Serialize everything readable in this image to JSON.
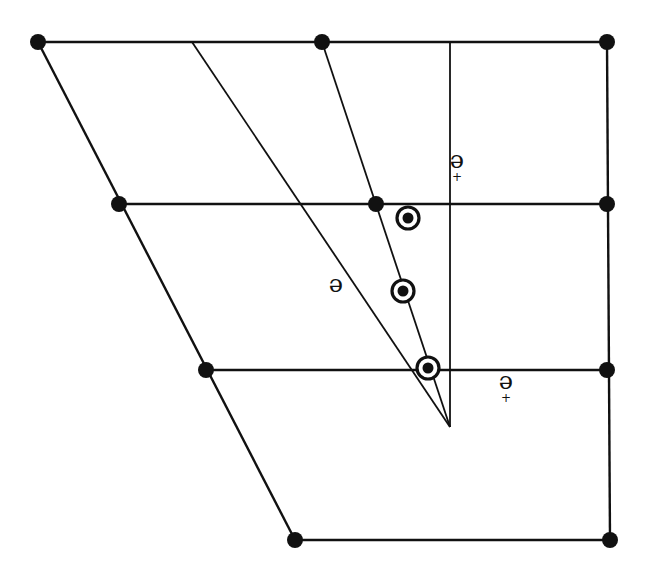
{
  "diagram": {
    "background": "#ffffff",
    "stroke_color": "#111111",
    "grid_lines": [
      {
        "name": "top-edge",
        "x1": 38,
        "y1": 42,
        "x2": 607,
        "y2": 42
      },
      {
        "name": "row-2-line",
        "x1": 119,
        "y1": 204,
        "x2": 607,
        "y2": 204
      },
      {
        "name": "row-3-line",
        "x1": 206,
        "y1": 370,
        "x2": 607,
        "y2": 370
      },
      {
        "name": "bottom-edge",
        "x1": 295,
        "y1": 540,
        "x2": 610,
        "y2": 540
      },
      {
        "name": "left-edge",
        "x1": 38,
        "y1": 42,
        "x2": 295,
        "y2": 540
      },
      {
        "name": "right-edge",
        "x1": 607,
        "y1": 42,
        "x2": 610,
        "y2": 540
      }
    ],
    "ray_lines": [
      {
        "name": "vertical-axis-line",
        "x1": 450,
        "y1": 42,
        "x2": 450,
        "y2": 427
      },
      {
        "name": "long-diagonal-ray",
        "x1": 192,
        "y1": 42,
        "x2": 450,
        "y2": 427
      },
      {
        "name": "steep-diagonal-ray",
        "x1": 322,
        "y1": 42,
        "x2": 450,
        "y2": 427
      }
    ],
    "apex": {
      "x": 450,
      "y": 427
    },
    "nodes": [
      {
        "name": "node-top-left",
        "x": 38,
        "y": 42
      },
      {
        "name": "node-top-mid",
        "x": 322,
        "y": 42
      },
      {
        "name": "node-top-right",
        "x": 607,
        "y": 42
      },
      {
        "name": "node-row2-left",
        "x": 119,
        "y": 204
      },
      {
        "name": "node-row2-mid",
        "x": 376,
        "y": 204
      },
      {
        "name": "node-row2-right",
        "x": 607,
        "y": 204
      },
      {
        "name": "node-row3-left",
        "x": 206,
        "y": 370
      },
      {
        "name": "node-row3-right",
        "x": 607,
        "y": 370
      },
      {
        "name": "node-bottom-left",
        "x": 295,
        "y": 540
      },
      {
        "name": "node-bottom-right",
        "x": 610,
        "y": 540
      }
    ],
    "targets": [
      {
        "name": "target-upper",
        "x": 408,
        "y": 218
      },
      {
        "name": "target-middle",
        "x": 403,
        "y": 291
      },
      {
        "name": "target-lower",
        "x": 428,
        "y": 368
      }
    ],
    "labels": [
      {
        "name": "angle-label-vertical",
        "text": "θ",
        "sub": "+",
        "x": 457,
        "y": 163,
        "rotated": true
      },
      {
        "name": "angle-label-diagonal",
        "text": "θ",
        "sub": "",
        "x": 336,
        "y": 287,
        "rotated": true
      },
      {
        "name": "angle-label-horizontal",
        "text": "θ",
        "sub": "+",
        "x": 506,
        "y": 384,
        "rotated": true
      }
    ]
  }
}
